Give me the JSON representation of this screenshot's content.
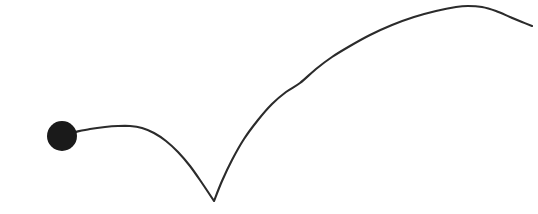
{
  "canvas": {
    "width": 538,
    "height": 214,
    "background_color": "#ffffff",
    "title": "Bouncing trajectory sketch"
  },
  "style": {
    "stroke_color": "#2b2b2b",
    "stroke_width": 2.1,
    "dot_color": "#1a1a1a"
  },
  "chart_data": {
    "type": "line",
    "title": "",
    "subtitle": "",
    "xlabel": "",
    "ylabel": "",
    "xlim": [
      0,
      538
    ],
    "ylim": [
      214,
      0
    ],
    "grid": false,
    "legend": null,
    "annotations": [],
    "tick_labels": {
      "x": [],
      "y": []
    },
    "series": [
      {
        "name": "trajectory",
        "kind": "hand-drawn-path",
        "note": "single continuous stroke: low arc from marker, sharp cusp bounce, tall arc to apex, descends off right edge",
        "points": [
          [
            75,
            132
          ],
          [
            90,
            129
          ],
          [
            105,
            127
          ],
          [
            118,
            126
          ],
          [
            130,
            126
          ],
          [
            142,
            128
          ],
          [
            154,
            133
          ],
          [
            166,
            141
          ],
          [
            178,
            152
          ],
          [
            190,
            166
          ],
          [
            202,
            183
          ],
          [
            214,
            201
          ],
          [
            222,
            181
          ],
          [
            232,
            160
          ],
          [
            244,
            139
          ],
          [
            258,
            120
          ],
          [
            272,
            104
          ],
          [
            286,
            92
          ],
          [
            300,
            83
          ],
          [
            316,
            69
          ],
          [
            332,
            57
          ],
          [
            350,
            46
          ],
          [
            370,
            35
          ],
          [
            392,
            25
          ],
          [
            414,
            17
          ],
          [
            436,
            11
          ],
          [
            456,
            7
          ],
          [
            468,
            6
          ],
          [
            482,
            7
          ],
          [
            496,
            11
          ],
          [
            510,
            17
          ],
          [
            522,
            22
          ],
          [
            532,
            26
          ]
        ]
      },
      {
        "name": "marker",
        "kind": "filled-circle",
        "points": [
          [
            62,
            136
          ]
        ],
        "radius": 15
      }
    ],
    "key_features": {
      "start_point": [
        75,
        132
      ],
      "first_peak": [
        130,
        126
      ],
      "cusp_bounce": [
        214,
        201
      ],
      "apex": [
        468,
        6
      ],
      "end_point": [
        532,
        26
      ]
    }
  }
}
